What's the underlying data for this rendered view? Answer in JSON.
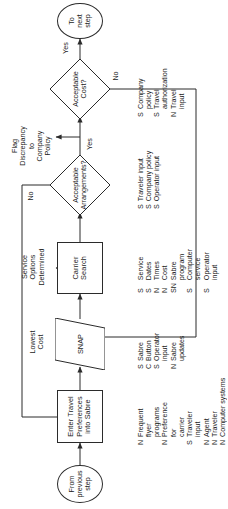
{
  "diagram": {
    "orientation": "rotated-90",
    "stroke_color": "#2b2b2b",
    "background_color": "#ffffff"
  },
  "nodes": {
    "start": {
      "label": "From\nprevious\nstep",
      "shape": "terminator"
    },
    "enter_prefs": {
      "label": "Enter Travel\nPreferences\ninto Sabre",
      "shape": "process"
    },
    "snap": {
      "label": "SNAP",
      "shape": "parallelogram"
    },
    "carrier_search": {
      "label": "Carrier\nSearch",
      "shape": "process"
    },
    "acceptable_arrangements": {
      "label": "Acceptable\nArrangements?",
      "shape": "decision"
    },
    "acceptable_cost": {
      "label": "Acceptable\nCost?",
      "shape": "decision"
    },
    "end": {
      "label": "To\nnext\nstep",
      "shape": "terminator"
    }
  },
  "edge_labels": {
    "lowest_cost": "Lowest\nCost",
    "service_options": "Service\nOptions\nDetermined",
    "arrangements_yes": "Yes",
    "arrangements_no": "No",
    "flag_discrepancy": "Flag\nDiscrepancy\nto\nCompany\nPolicy",
    "cost_yes": "Yes",
    "cost_no": "No"
  },
  "data_lists": {
    "enter_prefs": [
      {
        "code": "N",
        "text": "Frequent\nflyer\nprograms"
      },
      {
        "code": "N",
        "text": "Preference\nfor\ncarrier"
      },
      {
        "code": "S",
        "text": "Traveler\ninput"
      },
      {
        "code": "N",
        "text": "Agent"
      },
      {
        "code": "N",
        "text": "Traveler"
      },
      {
        "code": "N",
        "text": "Computer systems"
      },
      {
        "code": "N",
        "text": "Measurement systems"
      }
    ],
    "snap": [
      {
        "code": "S",
        "text": "Sabre"
      },
      {
        "code": "C",
        "text": "Button"
      },
      {
        "code": "S",
        "text": "Operator\ninput"
      },
      {
        "code": "N",
        "text": "Sabre\nupdates"
      }
    ],
    "carrier_search": [
      {
        "code": "S",
        "text": "Service"
      },
      {
        "code": "S",
        "text": "Dates"
      },
      {
        "code": "N",
        "text": "Times"
      },
      {
        "code": "N",
        "text": "Cost"
      },
      {
        "code": "SN",
        "text": "Sabre\nprogram"
      },
      {
        "code": "S",
        "text": "Computer\nservice"
      },
      {
        "code": "S",
        "text": "Operator\ninput"
      }
    ],
    "acceptable_arrangements": [
      {
        "code": "S",
        "text": "Traveler input"
      },
      {
        "code": "S",
        "text": "Company policy"
      },
      {
        "code": "S",
        "text": "Operator input"
      }
    ],
    "acceptable_cost": [
      {
        "code": "S",
        "text": "Company\npolicy"
      },
      {
        "code": "S",
        "text": "Travel\nauthorization"
      },
      {
        "code": "N",
        "text": "Travel\ninput"
      }
    ]
  }
}
